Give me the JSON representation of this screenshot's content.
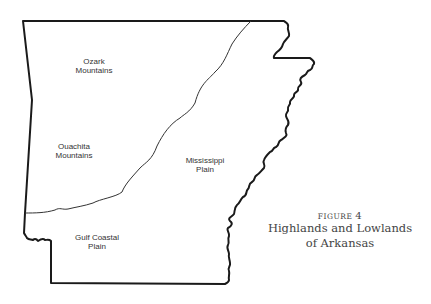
{
  "map": {
    "state": "Arkansas",
    "regions": [
      {
        "id": "ozark",
        "line1": "Ozark",
        "line2": "Mountains"
      },
      {
        "id": "ouachita",
        "line1": "Ouachita",
        "line2": "Mountains"
      },
      {
        "id": "mississippi",
        "line1": "Mississippi",
        "line2": "Plain"
      },
      {
        "id": "gulf",
        "line1": "Gulf Coastal",
        "line2": "Plain"
      }
    ],
    "colors": {
      "outline": "#1a1a1a",
      "divider": "#333333",
      "background": "#ffffff"
    }
  },
  "caption": {
    "figure_label": "FIGURE",
    "figure_number": "4",
    "title_line1": "Highlands and Lowlands",
    "title_line2": "of Arkansas"
  }
}
